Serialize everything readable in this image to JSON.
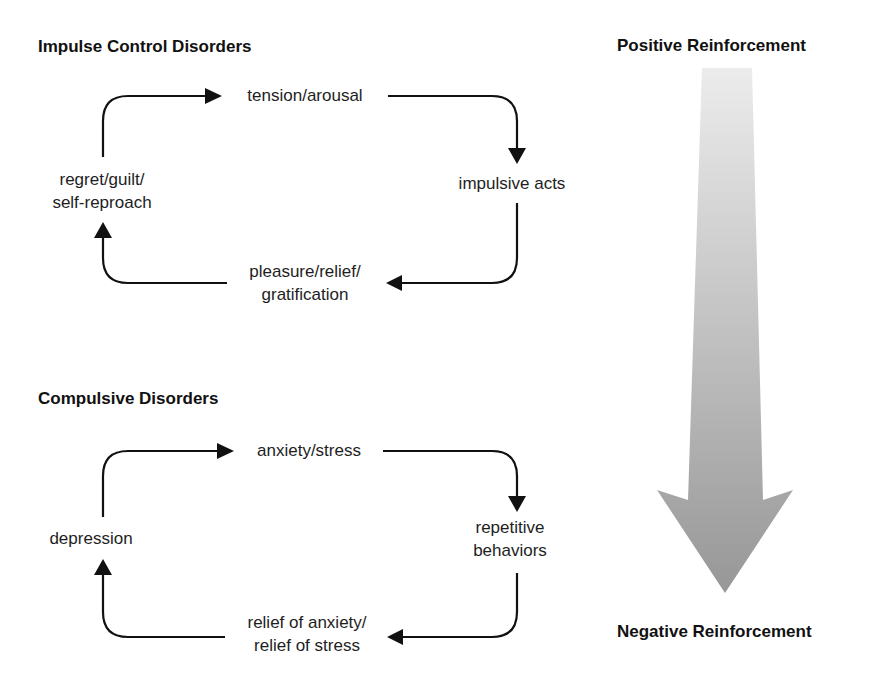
{
  "impulse_control": {
    "title": "Impulse Control Disorders",
    "nodes": {
      "top": [
        "tension/arousal"
      ],
      "right": [
        "impulsive acts"
      ],
      "bottom": [
        "pleasure/relief/",
        "gratification"
      ],
      "left": [
        "regret/guilt/",
        "self-reproach"
      ]
    }
  },
  "compulsive": {
    "title": "Compulsive Disorders",
    "nodes": {
      "top": [
        "anxiety/stress"
      ],
      "right": [
        "repetitive",
        "behaviors"
      ],
      "bottom": [
        "relief of anxiety/",
        "relief of stress"
      ],
      "left": [
        "depression"
      ]
    }
  },
  "reinforcement_axis": {
    "top_label": "Positive Reinforcement",
    "bottom_label": "Negative Reinforcement",
    "gradient_start": "#ececec",
    "gradient_end": "#979797"
  },
  "colors": {
    "arrow": "#111111",
    "text": "#1e1e1e"
  }
}
